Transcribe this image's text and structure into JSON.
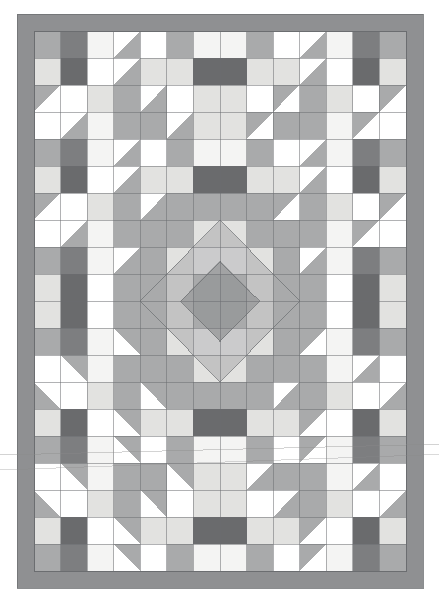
{
  "figure": {
    "type": "quilt-pattern-schematic",
    "canvas": {
      "width": 439,
      "height": 616,
      "background": "#ffffff"
    },
    "border": {
      "label": "outer border sashing",
      "color": "#8f9092",
      "outline": "#6e7073",
      "x": 17,
      "y": 14,
      "width": 406,
      "height": 574,
      "thickness": 17
    },
    "field": {
      "label": "pieced quilt field",
      "x": 34,
      "y": 31,
      "width": 372,
      "height": 540,
      "columns": 14,
      "rows": 20,
      "cell_width": 26.571,
      "cell_height": 27.0,
      "grid_line_color": "#6b6d70",
      "grid_line_width": 0.7
    },
    "palette": {
      "white": "#ffffff",
      "offwhite": "#f4f4f3",
      "light": "#e2e2e0",
      "lightgray": "#cfcfcd",
      "medium": "#a9aaab",
      "mediumdark": "#949597",
      "dark": "#7d7e80",
      "darkest": "#6a6b6d",
      "outline": "#6b6d70",
      "border": "#8f9092"
    },
    "palette_labels": [
      "white background",
      "off-white",
      "light gray",
      "pale gray",
      "medium gray",
      "medium-dark gray",
      "dark gray",
      "darkest gray"
    ],
    "symmetry": {
      "horizontal_mirror": true,
      "vertical_mirror": true,
      "center_x": 220,
      "center_y": 301,
      "note": "four-fold mirrored medallion layout"
    },
    "blocks": {
      "unit_cells": 2,
      "description": "alternating chain blocks and half-square-triangle blocks forming concentric diamonds"
    },
    "artifacts": [
      {
        "name": "scan-line-upper",
        "y": 455,
        "skew": -0.9,
        "opacity": 0.42
      },
      {
        "name": "scan-line-lower",
        "y": 470,
        "skew": -1.3,
        "opacity": 0.35
      }
    ]
  },
  "chart_data": {
    "type": "heatmap",
    "xlabel": "",
    "ylabel": "",
    "grid": true,
    "legend": "none",
    "categories_x": [
      "1",
      "2",
      "3",
      "4",
      "5",
      "6",
      "7",
      "8",
      "9",
      "10",
      "11",
      "12",
      "13",
      "14"
    ],
    "categories_y": [
      "1",
      "2",
      "3",
      "4",
      "5",
      "6",
      "7",
      "8",
      "9",
      "10",
      "11",
      "12",
      "13",
      "14",
      "15",
      "16",
      "17",
      "18",
      "19",
      "20"
    ],
    "value_scale": [
      "white",
      "offwhite",
      "light",
      "lightgray",
      "medium",
      "mediumdark",
      "dark",
      "darkest"
    ],
    "cells": [
      [
        "medium",
        "dark",
        "offwhite",
        "tri_tl_white_medium",
        "white",
        "medium",
        "offwhite",
        "offwhite",
        "medium",
        "white",
        "tri_tl_white_medium",
        "offwhite",
        "dark",
        "medium"
      ],
      [
        "light",
        "darkest",
        "white",
        "tri_tl_white_medium",
        "light",
        "light",
        "darkest",
        "darkest",
        "light",
        "light",
        "tri_tl_white_medium",
        "white",
        "darkest",
        "light"
      ],
      [
        "tri_tl_medium_white",
        "white",
        "light",
        "medium",
        "tri_tl_white_medium",
        "white",
        "light",
        "light",
        "white",
        "tri_tl_medium_white",
        "medium",
        "light",
        "white",
        "tri_tl_medium_white"
      ],
      [
        "white",
        "tri_tl_white_medium",
        "offwhite",
        "medium",
        "medium",
        "tri_tl_white_medium",
        "light",
        "light",
        "tri_tl_medium_white",
        "medium",
        "medium",
        "offwhite",
        "tri_tl_medium_white",
        "white"
      ],
      [
        "medium",
        "dark",
        "offwhite",
        "tri_tl_white_medium",
        "white",
        "medium",
        "offwhite",
        "offwhite",
        "medium",
        "white",
        "tri_tl_white_medium",
        "offwhite",
        "dark",
        "medium"
      ],
      [
        "light",
        "darkest",
        "white",
        "tri_tl_white_medium",
        "light",
        "light",
        "darkest",
        "darkest",
        "light",
        "light",
        "tri_tl_white_medium",
        "white",
        "darkest",
        "light"
      ],
      [
        "tri_tl_medium_white",
        "white",
        "light",
        "medium",
        "tri_tl_white_medium",
        "medium",
        "medium",
        "medium",
        "medium",
        "tri_tl_medium_white",
        "medium",
        "light",
        "white",
        "tri_tl_medium_white"
      ],
      [
        "white",
        "tri_tl_white_medium",
        "offwhite",
        "medium",
        "medium",
        "medium",
        "light",
        "light",
        "medium",
        "medium",
        "medium",
        "offwhite",
        "tri_tl_medium_white",
        "white"
      ],
      [
        "medium",
        "dark",
        "offwhite",
        "tri_tl_white_medium",
        "medium",
        "light",
        "offwhite",
        "offwhite",
        "light",
        "medium",
        "tri_tl_white_medium",
        "offwhite",
        "dark",
        "medium"
      ],
      [
        "light",
        "darkest",
        "white",
        "medium",
        "medium",
        "light",
        "medium",
        "medium",
        "light",
        "medium",
        "medium",
        "white",
        "darkest",
        "light"
      ],
      [
        "light",
        "darkest",
        "white",
        "medium",
        "medium",
        "light",
        "medium",
        "medium",
        "light",
        "medium",
        "medium",
        "white",
        "darkest",
        "light"
      ],
      [
        "medium",
        "dark",
        "offwhite",
        "tri_bl_white_medium",
        "medium",
        "light",
        "offwhite",
        "offwhite",
        "light",
        "medium",
        "tri_br_white_medium",
        "offwhite",
        "dark",
        "medium"
      ],
      [
        "white",
        "tri_bl_white_medium",
        "offwhite",
        "medium",
        "medium",
        "medium",
        "light",
        "light",
        "medium",
        "medium",
        "medium",
        "offwhite",
        "tri_br_medium_white",
        "white"
      ],
      [
        "tri_bl_medium_white",
        "white",
        "light",
        "medium",
        "tri_bl_white_medium",
        "medium",
        "medium",
        "medium",
        "medium",
        "tri_br_medium_white",
        "medium",
        "light",
        "white",
        "tri_br_medium_white"
      ],
      [
        "light",
        "darkest",
        "white",
        "tri_bl_white_medium",
        "light",
        "light",
        "darkest",
        "darkest",
        "light",
        "light",
        "tri_br_white_medium",
        "white",
        "darkest",
        "light"
      ],
      [
        "medium",
        "dark",
        "offwhite",
        "tri_bl_white_medium",
        "white",
        "medium",
        "offwhite",
        "offwhite",
        "medium",
        "white",
        "tri_br_white_medium",
        "offwhite",
        "dark",
        "medium"
      ],
      [
        "white",
        "tri_bl_white_medium",
        "offwhite",
        "medium",
        "medium",
        "tri_bl_white_medium",
        "light",
        "light",
        "tri_br_medium_white",
        "medium",
        "medium",
        "offwhite",
        "tri_br_medium_white",
        "white"
      ],
      [
        "tri_bl_medium_white",
        "white",
        "light",
        "medium",
        "tri_bl_white_medium",
        "white",
        "light",
        "light",
        "white",
        "tri_br_medium_white",
        "medium",
        "light",
        "white",
        "tri_br_medium_white"
      ],
      [
        "light",
        "darkest",
        "white",
        "tri_bl_white_medium",
        "light",
        "light",
        "darkest",
        "darkest",
        "light",
        "light",
        "tri_br_white_medium",
        "white",
        "darkest",
        "light"
      ],
      [
        "medium",
        "dark",
        "offwhite",
        "tri_bl_white_medium",
        "white",
        "medium",
        "offwhite",
        "offwhite",
        "medium",
        "white",
        "tri_br_white_medium",
        "offwhite",
        "dark",
        "medium"
      ]
    ]
  }
}
